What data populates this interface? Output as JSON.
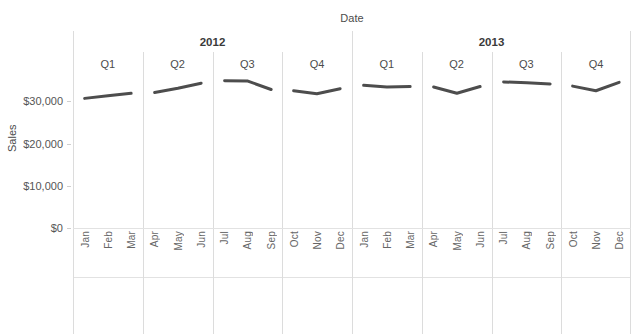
{
  "chart_data": {
    "type": "line",
    "title": "",
    "xlabel": "Date",
    "ylabel": "Sales",
    "ylim": [
      0,
      36000
    ],
    "yticks": [
      0,
      10000,
      20000,
      30000
    ],
    "ytick_labels": [
      "$0",
      "$10,000",
      "$20,000",
      "$30,000"
    ],
    "grid": false,
    "legend": "none",
    "x": [
      "Jan",
      "Feb",
      "Mar",
      "Apr",
      "May",
      "Jun",
      "Jul",
      "Aug",
      "Sep",
      "Oct",
      "Nov",
      "Dec",
      "Jan",
      "Feb",
      "Mar",
      "Apr",
      "May",
      "Jun",
      "Jul",
      "Aug",
      "Sep",
      "Oct",
      "Nov",
      "Dec"
    ],
    "series": [
      {
        "name": "Sales",
        "color": "#4d4d4d",
        "values": [
          30700,
          31300,
          31900,
          32100,
          33100,
          34300,
          34900,
          34800,
          32800,
          32500,
          31800,
          33000,
          33800,
          33400,
          33500,
          33400,
          31900,
          33500,
          34600,
          34400,
          34100,
          33600,
          32500,
          34500
        ]
      }
    ],
    "panels": [
      {
        "year": "2012",
        "quarter": "Q1",
        "months": [
          "Jan",
          "Feb",
          "Mar"
        ]
      },
      {
        "year": "2012",
        "quarter": "Q2",
        "months": [
          "Apr",
          "May",
          "Jun"
        ]
      },
      {
        "year": "2012",
        "quarter": "Q3",
        "months": [
          "Jul",
          "Aug",
          "Sep"
        ]
      },
      {
        "year": "2012",
        "quarter": "Q4",
        "months": [
          "Oct",
          "Nov",
          "Dec"
        ]
      },
      {
        "year": "2013",
        "quarter": "Q1",
        "months": [
          "Jan",
          "Feb",
          "Mar"
        ]
      },
      {
        "year": "2013",
        "quarter": "Q2",
        "months": [
          "Apr",
          "May",
          "Jun"
        ]
      },
      {
        "year": "2013",
        "quarter": "Q3",
        "months": [
          "Jul",
          "Aug",
          "Sep"
        ]
      },
      {
        "year": "2013",
        "quarter": "Q4",
        "months": [
          "Oct",
          "Nov",
          "Dec"
        ]
      }
    ],
    "years": [
      {
        "label": "2012",
        "span": 4
      },
      {
        "label": "2013",
        "span": 4
      }
    ]
  },
  "axis": {
    "x_title": "Date",
    "y_title": "Sales"
  }
}
